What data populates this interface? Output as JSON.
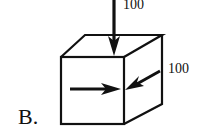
{
  "figure": {
    "option_label": "B.",
    "forces": [
      {
        "id": "top",
        "magnitude_label": "100",
        "direction": "downward onto top face"
      },
      {
        "id": "side",
        "magnitude_label": "100",
        "direction": "inward onto right face"
      },
      {
        "id": "front",
        "magnitude_label": "",
        "direction": "rightward inside front face"
      }
    ],
    "colors": {
      "stroke": "#111111",
      "background": "#ffffff"
    }
  }
}
